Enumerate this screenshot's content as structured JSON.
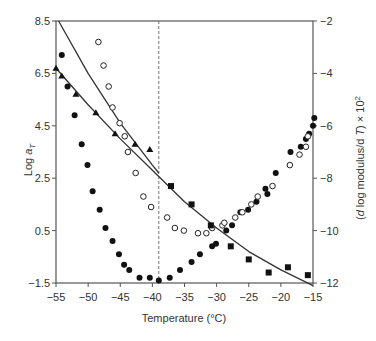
{
  "chart_data": {
    "type": "scatter",
    "title": "",
    "xlabel": "Temperature (°C)",
    "ylabel_left": "Log a_T",
    "ylabel_right": "(d log modulus/d T) × 10^2",
    "xlim": [
      -55,
      -15
    ],
    "ylim_left": [
      -1.5,
      8.5
    ],
    "ylim_right": [
      -12,
      -2
    ],
    "x_ticks": [
      -55,
      -50,
      -45,
      -40,
      -35,
      -30,
      -25,
      -20,
      -15
    ],
    "x_tick_labels": [
      "−55",
      "−50",
      "−45",
      "−40",
      "−35",
      "−30",
      "−25",
      "−20",
      "−15"
    ],
    "y_left_ticks": [
      8.5,
      6.5,
      4.5,
      2.5,
      0.5,
      -1.5
    ],
    "y_left_tick_labels": [
      "8.5",
      "6.5",
      "4.5",
      "2.5",
      "0.5",
      "−1.5"
    ],
    "y_right_ticks": [
      -2,
      -4,
      -6,
      -8,
      -10,
      -12
    ],
    "y_right_tick_labels": [
      "−2",
      "−4",
      "−6",
      "−8",
      "−10",
      "−12"
    ],
    "grid": false,
    "legend": null,
    "annotations": [
      {
        "type": "vertical-dashed-line",
        "x": -39
      }
    ],
    "series": [
      {
        "name": "Filled circles (derivative, right axis)",
        "marker": "filled-circle",
        "axis": "right",
        "points": [
          [
            -54.1,
            -3.3
          ],
          [
            -53.2,
            -4.5
          ],
          [
            -52.1,
            -5.6
          ],
          [
            -51.0,
            -6.7
          ],
          [
            -50.1,
            -7.5
          ],
          [
            -49.3,
            -8.5
          ],
          [
            -48.2,
            -9.2
          ],
          [
            -47.3,
            -9.9
          ],
          [
            -46.2,
            -10.4
          ],
          [
            -45.2,
            -10.9
          ],
          [
            -44.4,
            -11.3
          ],
          [
            -43.6,
            -11.5
          ],
          [
            -42.0,
            -11.8
          ],
          [
            -40.4,
            -11.8
          ],
          [
            -39.0,
            -11.9
          ],
          [
            -37.3,
            -11.8
          ],
          [
            -35.7,
            -11.5
          ],
          [
            -33.9,
            -11.2
          ],
          [
            -32.6,
            -10.9
          ],
          [
            -30.7,
            -10.6
          ],
          [
            -30.1,
            -10.5
          ],
          [
            -28.5,
            -10.0
          ],
          [
            -27.6,
            -9.8
          ],
          [
            -26.3,
            -9.3
          ],
          [
            -25.1,
            -9.2
          ],
          [
            -23.8,
            -8.9
          ],
          [
            -22.4,
            -8.4
          ],
          [
            -22.1,
            -8.6
          ],
          [
            -20.8,
            -7.8
          ],
          [
            -18.5,
            -7.0
          ],
          [
            -16.9,
            -6.8
          ],
          [
            -16.1,
            -6.5
          ],
          [
            -15.6,
            -6.3
          ],
          [
            -15.0,
            -6.0
          ],
          [
            -14.8,
            -5.7
          ]
        ]
      },
      {
        "name": "Open circles (derivative, right axis)",
        "marker": "open-circle",
        "axis": "right",
        "points": [
          [
            -48.4,
            -2.8
          ],
          [
            -47.6,
            -3.7
          ],
          [
            -46.8,
            -4.5
          ],
          [
            -46.2,
            -5.3
          ],
          [
            -45.1,
            -5.9
          ],
          [
            -44.3,
            -6.4
          ],
          [
            -43.8,
            -7.0
          ],
          [
            -42.6,
            -7.8
          ],
          [
            -41.4,
            -8.7
          ],
          [
            -40.2,
            -9.1
          ],
          [
            -37.7,
            -9.5
          ],
          [
            -36.5,
            -9.9
          ],
          [
            -35.1,
            -10.0
          ],
          [
            -32.9,
            -10.1
          ],
          [
            -31.6,
            -10.1
          ],
          [
            -30.7,
            -9.9
          ],
          [
            -29.1,
            -9.8
          ],
          [
            -28.8,
            -9.7
          ],
          [
            -27.1,
            -9.5
          ],
          [
            -26.0,
            -9.3
          ],
          [
            -24.6,
            -9.0
          ],
          [
            -23.6,
            -8.7
          ],
          [
            -21.3,
            -8.3
          ],
          [
            -18.6,
            -7.5
          ],
          [
            -17.1,
            -7.1
          ],
          [
            -16.1,
            -6.8
          ],
          [
            -15.8,
            -6.4
          ]
        ]
      },
      {
        "name": "Triangles (log a_T, left axis)",
        "marker": "filled-triangle",
        "axis": "left",
        "points": [
          [
            -55.0,
            6.7
          ],
          [
            -54.1,
            6.4
          ],
          [
            -51.9,
            5.7
          ],
          [
            -48.8,
            5.0
          ],
          [
            -45.8,
            4.2
          ],
          [
            -42.7,
            3.8
          ],
          [
            -40.4,
            3.6
          ]
        ]
      },
      {
        "name": "Squares (log a_T, left axis)",
        "marker": "filled-square",
        "axis": "left",
        "points": [
          [
            -37.1,
            2.2
          ],
          [
            -33.9,
            1.5
          ],
          [
            -30.9,
            0.7
          ],
          [
            -27.8,
            -0.1
          ],
          [
            -25.0,
            -0.6
          ],
          [
            -21.9,
            -1.1
          ],
          [
            -18.9,
            -0.9
          ],
          [
            -15.8,
            -1.2
          ]
        ]
      },
      {
        "name": "Fit curve 1 (lower, through triangles and squares)",
        "marker": "line",
        "axis": "left",
        "points": [
          [
            -55,
            6.7
          ],
          [
            -50,
            5.3
          ],
          [
            -45,
            4.0
          ],
          [
            -40,
            2.8
          ],
          [
            -35,
            1.6
          ],
          [
            -30,
            0.6
          ],
          [
            -25,
            -0.3
          ],
          [
            -20,
            -1.0
          ],
          [
            -15,
            -1.6
          ]
        ]
      },
      {
        "name": "Fit curve 2 (upper, steeper)",
        "marker": "line",
        "axis": "left",
        "points": [
          [
            -54.6,
            8.5
          ],
          [
            -50,
            6.5
          ],
          [
            -45,
            4.6
          ],
          [
            -40,
            3.0
          ],
          [
            -39,
            2.7
          ]
        ]
      }
    ]
  },
  "colors": {
    "axis": "#555555",
    "markers": "#111111",
    "curves": "#333333",
    "background": "#ffffff"
  }
}
